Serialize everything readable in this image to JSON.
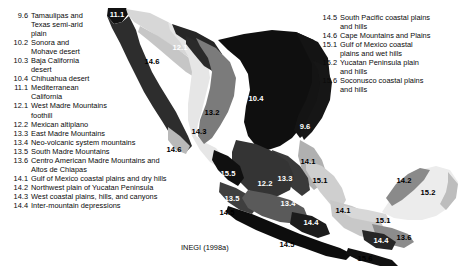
{
  "source": {
    "text": "INEGI (1998a)"
  },
  "legend": {
    "left": [
      {
        "code": "9.6",
        "lines": [
          "Tamaulipas and",
          "Texas semi-arid",
          "plain"
        ]
      },
      {
        "code": "10.2",
        "lines": [
          "Sonora and",
          "Mohave desert"
        ]
      },
      {
        "code": "10.3",
        "lines": [
          "Baja California",
          "desert"
        ]
      },
      {
        "code": "10.4",
        "lines": [
          "Chihuahua desert"
        ]
      },
      {
        "code": "11.1",
        "lines": [
          "Mediterranean",
          "California"
        ]
      },
      {
        "code": "12.1",
        "lines": [
          "West Madre Mountains",
          "foothill"
        ]
      },
      {
        "code": "12.2",
        "lines": [
          "Mexican altiplano"
        ]
      },
      {
        "code": "13.3",
        "lines": [
          "East Madre Mountains"
        ]
      },
      {
        "code": "13.4",
        "lines": [
          "Neo-volcanic system mountains"
        ]
      },
      {
        "code": "13.5",
        "lines": [
          "South Madre Mountains"
        ]
      },
      {
        "code": "13.6",
        "lines": [
          "Centro American Madre Mountains and",
          "Altos de Chiapas"
        ]
      },
      {
        "code": "14.1",
        "lines": [
          "Gulf of Mexico coastal plains and dry hills"
        ]
      },
      {
        "code": "14.2",
        "lines": [
          "Northwest plain of Yucatan Peninsula"
        ]
      },
      {
        "code": "14.3",
        "lines": [
          "West coastal plains, hills, and canyons"
        ]
      },
      {
        "code": "14.4",
        "lines": [
          "Inter-mountain depressions"
        ]
      }
    ],
    "right": [
      {
        "code": "14.5",
        "lines": [
          "South Pacific coastal plains",
          "and hills"
        ]
      },
      {
        "code": "14.6",
        "lines": [
          "Cape Mountains and Plains"
        ]
      },
      {
        "code": "15.1",
        "lines": [
          "Gulf of Mexico coastal",
          "plains and wet hills"
        ]
      },
      {
        "code": "15.2",
        "lines": [
          "Yucatan Peninsula plain",
          "and hills"
        ]
      },
      {
        "code": "15.6",
        "lines": [
          "Soconusco coastal plains",
          "and hills"
        ]
      }
    ]
  },
  "map": {
    "labels": [
      {
        "code": "11.1",
        "x": 117,
        "y": 14,
        "tone": "dark"
      },
      {
        "code": "12.1",
        "x": 180,
        "y": 47,
        "tone": "dark"
      },
      {
        "code": "14.6",
        "x": 152,
        "y": 61,
        "tone": "light"
      },
      {
        "code": "10.3",
        "x": 129,
        "y": 85,
        "tone": "dark"
      },
      {
        "code": "10.4",
        "x": 256,
        "y": 98,
        "tone": "dark"
      },
      {
        "code": "13.2",
        "x": 212,
        "y": 112,
        "tone": "light"
      },
      {
        "code": "14.3",
        "x": 199,
        "y": 131,
        "tone": "light"
      },
      {
        "code": "14.6",
        "x": 174,
        "y": 149,
        "tone": "light"
      },
      {
        "code": "9.6",
        "x": 305,
        "y": 126,
        "tone": "dark"
      },
      {
        "code": "14.1",
        "x": 308,
        "y": 161,
        "tone": "light"
      },
      {
        "code": "15.5",
        "x": 228,
        "y": 173,
        "tone": "dark"
      },
      {
        "code": "13.3",
        "x": 285,
        "y": 178,
        "tone": "dark"
      },
      {
        "code": "15.1",
        "x": 320,
        "y": 180,
        "tone": "light"
      },
      {
        "code": "12.2",
        "x": 265,
        "y": 183,
        "tone": "dark"
      },
      {
        "code": "13.5",
        "x": 232,
        "y": 198,
        "tone": "dark"
      },
      {
        "code": "13.4",
        "x": 288,
        "y": 203,
        "tone": "dark"
      },
      {
        "code": "14.5",
        "x": 227,
        "y": 212,
        "tone": "light"
      },
      {
        "code": "14.1",
        "x": 343,
        "y": 210,
        "tone": "light"
      },
      {
        "code": "14.4",
        "x": 311,
        "y": 222,
        "tone": "dark"
      },
      {
        "code": "14.2",
        "x": 404,
        "y": 180,
        "tone": "light"
      },
      {
        "code": "15.2",
        "x": 428,
        "y": 192,
        "tone": "light"
      },
      {
        "code": "15.1",
        "x": 383,
        "y": 220,
        "tone": "light"
      },
      {
        "code": "13.6",
        "x": 404,
        "y": 237,
        "tone": "light"
      },
      {
        "code": "14.4",
        "x": 381,
        "y": 240,
        "tone": "dark"
      },
      {
        "code": "14.5",
        "x": 287,
        "y": 244,
        "tone": "light"
      },
      {
        "code": "15.6",
        "x": 365,
        "y": 258,
        "tone": "light"
      }
    ],
    "colors": {
      "black": "#0d0d0d",
      "very-dark-gray": "#2b2b2b",
      "dark-gray": "#4a4a4a",
      "mid-gray": "#707070",
      "gray": "#8f8f8f",
      "light-gray": "#b5b5b5",
      "pale-gray": "#d2d2d2",
      "very-pale-gray": "#e4e4e4",
      "near-white": "#f1f1f1",
      "background": "#ffffff"
    }
  }
}
